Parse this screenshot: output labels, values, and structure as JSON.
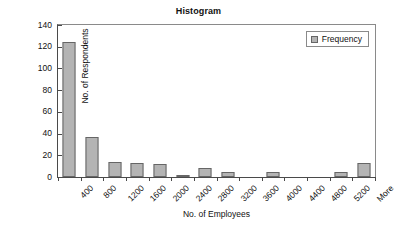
{
  "chart_data": {
    "type": "bar",
    "title": "Histogram",
    "xlabel": "No. of Employees",
    "ylabel": "No. of Respondents",
    "categories": [
      "400",
      "800",
      "1200",
      "1600",
      "2000",
      "2400",
      "2800",
      "3200",
      "3600",
      "4000",
      "4400",
      "4800",
      "5200",
      "More"
    ],
    "values": [
      124,
      37,
      14,
      13,
      12,
      2,
      8,
      5,
      0,
      5,
      0,
      0,
      5,
      13
    ],
    "series": [
      {
        "name": "Frequency",
        "values": [
          124,
          37,
          14,
          13,
          12,
          2,
          8,
          5,
          0,
          5,
          0,
          0,
          5,
          13
        ]
      }
    ],
    "ylim": [
      0,
      140
    ],
    "ytick_values": [
      0,
      20,
      40,
      60,
      80,
      100,
      120,
      140
    ],
    "ytick_labels": [
      "0",
      "20",
      "40",
      "60",
      "80",
      "100",
      "120",
      "140"
    ],
    "grid": false,
    "legend": {
      "position": "top-right",
      "entries": [
        {
          "label": "Frequency",
          "swatch_name": "frequency-swatch"
        }
      ]
    },
    "colors": {
      "bar_fill": "#b4b4b4",
      "bar_border": "#666666",
      "axis": "#4a4a4a",
      "frame": "#8a8a8a",
      "text": "#111111",
      "background": "#ffffff"
    }
  }
}
